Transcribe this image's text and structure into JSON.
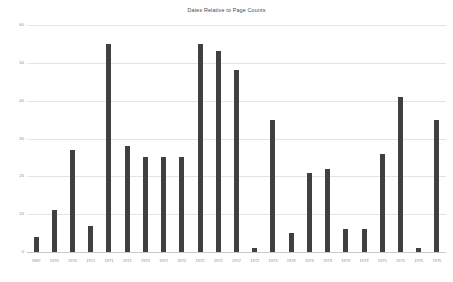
{
  "chart_data": {
    "type": "bar",
    "title": "Dates Relative to Page Counts",
    "xlabel": "",
    "ylabel": "",
    "ylim": [
      0,
      60
    ],
    "ytick_values": [
      0,
      10,
      20,
      30,
      40,
      50,
      60
    ],
    "ytick_labels": [
      "0",
      "10",
      "20",
      "30",
      "40",
      "50",
      "60"
    ],
    "grid": true,
    "legend": false,
    "bar_color": "#404040",
    "gridline_color": "#E4E4E4",
    "background_color": "#FFFFFF",
    "categories": [
      "1969",
      "1970",
      "1970",
      "1971",
      "1971",
      "1971",
      "1972",
      "1972",
      "1972",
      "1972",
      "1972",
      "1972",
      "1972",
      "1973",
      "1973",
      "1973",
      "1973",
      "1973",
      "1973",
      "1975",
      "1975",
      "1975",
      "1975"
    ],
    "values": [
      4,
      11,
      27,
      7,
      55,
      28,
      25,
      25,
      25,
      55,
      53,
      48,
      1,
      35,
      5,
      21,
      22,
      6,
      6,
      26,
      41,
      1,
      35
    ]
  }
}
